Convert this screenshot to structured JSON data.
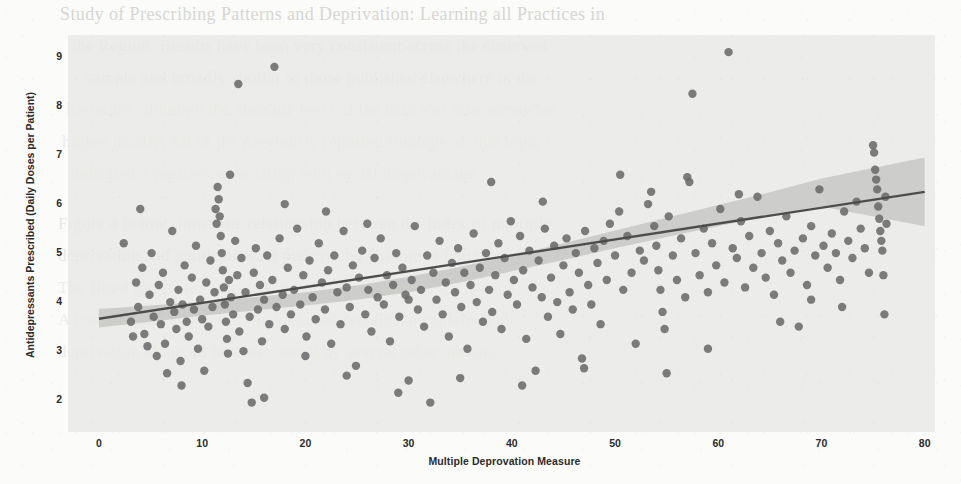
{
  "page": {
    "kind": "scanned-journal-page-with-figure",
    "background_color": "#fbfbfa",
    "ghost_text": [
      {
        "text": "Study of Prescribing Patterns and Deprivation: Learning all Practices in",
        "x": 60,
        "y": 4,
        "size": 18,
        "class": ""
      },
      {
        "text": "the Region. Results have been very consistent across the observed",
        "x": 72,
        "y": 36,
        "size": 17,
        "class": "faded"
      },
      {
        "text": "sample and broadly similar to those published elsewhere in the",
        "x": 86,
        "y": 68,
        "size": 17,
        "class": "faded"
      },
      {
        "text": "literature, although the absolute level of the data was also somewhat",
        "x": 66,
        "y": 100,
        "size": 17,
        "class": "faded2"
      },
      {
        "text": "higher locally. All of the previously reported findings on this topic",
        "x": 62,
        "y": 132,
        "size": 17,
        "class": "faded2"
      },
      {
        "text": "indicated a positive association with social disadvantage.",
        "x": 70,
        "y": 164,
        "size": 17,
        "class": "faded2"
      },
      {
        "text": "Figure 4 below shows the relationship between the index of multiple",
        "x": 58,
        "y": 214,
        "size": 17,
        "class": "faded"
      },
      {
        "text": "deprivation and antidepressant prescribing volume at practice level.",
        "x": 58,
        "y": 246,
        "size": 17,
        "class": "faded"
      },
      {
        "text": "The fitted regression line and its confidence interval are shown.",
        "x": 58,
        "y": 278,
        "size": 17,
        "class": "faded2"
      },
      {
        "text": "A considerable amount of the variation remains unexplained by",
        "x": 58,
        "y": 310,
        "size": 17,
        "class": "faded2"
      },
      {
        "text": "deprivation alone, as has been noted by several other authors.",
        "x": 58,
        "y": 342,
        "size": 17,
        "class": "faded2"
      }
    ]
  },
  "chart_data": {
    "type": "scatter",
    "title": "",
    "xlabel": "Multiple Deprovation Measure",
    "ylabel": "Antidepressants Prescribed (Daily Doses per Patient)",
    "xlim": [
      -3,
      81
    ],
    "ylim": [
      1.35,
      9.45
    ],
    "xticks": [
      0,
      10,
      20,
      30,
      40,
      50,
      60,
      70,
      80
    ],
    "yticks": [
      2,
      3,
      4,
      5,
      6,
      7,
      8,
      9
    ],
    "grid": false,
    "legend": null,
    "marker_color": "#6b6b6b",
    "marker_size": 5.2,
    "plot_bg_color": "#e9e9e6",
    "regression": {
      "color": "#4d4d4d",
      "x": [
        0,
        80
      ],
      "y": [
        3.66,
        6.25
      ],
      "slope": 0.0324,
      "intercept": 3.66,
      "band_color": "#b5b5b0",
      "band_lower": [
        3.48,
        3.6,
        3.72,
        3.83,
        3.93,
        4.05,
        4.2,
        4.4,
        4.63,
        4.86,
        5.1,
        5.33,
        5.55,
        5.76,
        5.95
      ],
      "band_upper": [
        3.86,
        3.93,
        4.01,
        4.1,
        4.2,
        4.34,
        4.52,
        4.72,
        4.95,
        5.2,
        5.46,
        5.72,
        5.98,
        6.24,
        6.52
      ],
      "band_x": [
        0,
        5,
        10,
        15,
        20,
        25,
        30,
        35,
        40,
        45,
        50,
        55,
        60,
        65,
        70
      ]
    },
    "points": [
      [
        2.4,
        5.2
      ],
      [
        3.1,
        3.6
      ],
      [
        3.3,
        3.3
      ],
      [
        3.6,
        4.4
      ],
      [
        3.8,
        3.9
      ],
      [
        4.0,
        5.9
      ],
      [
        4.2,
        4.7
      ],
      [
        4.4,
        3.35
      ],
      [
        4.7,
        3.1
      ],
      [
        4.9,
        4.15
      ],
      [
        5.1,
        5.0
      ],
      [
        5.3,
        3.7
      ],
      [
        5.6,
        2.9
      ],
      [
        5.8,
        4.35
      ],
      [
        6.0,
        3.55
      ],
      [
        6.2,
        4.6
      ],
      [
        6.4,
        3.15
      ],
      [
        6.6,
        2.55
      ],
      [
        6.9,
        4.0
      ],
      [
        7.1,
        5.45
      ],
      [
        7.3,
        3.8
      ],
      [
        7.5,
        3.45
      ],
      [
        7.7,
        4.25
      ],
      [
        7.9,
        2.8
      ],
      [
        8.1,
        3.95
      ],
      [
        8.3,
        4.75
      ],
      [
        8.5,
        3.6
      ],
      [
        8.7,
        3.3
      ],
      [
        9.0,
        4.5
      ],
      [
        9.2,
        3.85
      ],
      [
        9.4,
        5.15
      ],
      [
        9.6,
        3.05
      ],
      [
        9.8,
        4.05
      ],
      [
        10.0,
        3.65
      ],
      [
        10.2,
        2.6
      ],
      [
        10.4,
        4.4
      ],
      [
        10.6,
        3.5
      ],
      [
        10.8,
        4.85
      ],
      [
        11.0,
        3.9
      ],
      [
        11.2,
        4.2
      ],
      [
        11.4,
        5.6
      ],
      [
        11.5,
        6.35
      ],
      [
        11.6,
        6.1
      ],
      [
        11.7,
        5.75
      ],
      [
        11.8,
        5.35
      ],
      [
        11.9,
        5.0
      ],
      [
        12.0,
        4.65
      ],
      [
        12.1,
        4.3
      ],
      [
        12.2,
        3.95
      ],
      [
        12.3,
        3.6
      ],
      [
        12.4,
        3.25
      ],
      [
        12.5,
        2.95
      ],
      [
        12.6,
        4.45
      ],
      [
        12.8,
        4.1
      ],
      [
        13.0,
        3.75
      ],
      [
        13.2,
        5.25
      ],
      [
        13.4,
        4.55
      ],
      [
        13.5,
        8.45
      ],
      [
        13.6,
        3.4
      ],
      [
        13.8,
        4.9
      ],
      [
        14.0,
        3.0
      ],
      [
        14.2,
        4.2
      ],
      [
        14.4,
        2.35
      ],
      [
        14.6,
        3.7
      ],
      [
        14.8,
        1.95
      ],
      [
        15.0,
        4.6
      ],
      [
        15.2,
        5.1
      ],
      [
        15.4,
        3.85
      ],
      [
        15.6,
        4.35
      ],
      [
        15.8,
        3.2
      ],
      [
        16.0,
        4.05
      ],
      [
        16.3,
        4.95
      ],
      [
        16.5,
        3.55
      ],
      [
        16.8,
        4.45
      ],
      [
        17.0,
        8.8
      ],
      [
        17.2,
        3.9
      ],
      [
        17.5,
        5.3
      ],
      [
        17.8,
        4.15
      ],
      [
        18.0,
        3.45
      ],
      [
        18.3,
        4.7
      ],
      [
        18.6,
        3.75
      ],
      [
        18.9,
        4.25
      ],
      [
        19.2,
        5.5
      ],
      [
        19.5,
        3.95
      ],
      [
        19.8,
        4.55
      ],
      [
        20.1,
        3.3
      ],
      [
        20.4,
        4.85
      ],
      [
        20.7,
        4.1
      ],
      [
        21.0,
        3.65
      ],
      [
        21.3,
        5.2
      ],
      [
        21.6,
        4.4
      ],
      [
        21.9,
        3.85
      ],
      [
        22.2,
        4.65
      ],
      [
        22.5,
        3.15
      ],
      [
        22.8,
        4.95
      ],
      [
        23.1,
        4.2
      ],
      [
        23.4,
        3.55
      ],
      [
        23.7,
        5.45
      ],
      [
        24.0,
        4.3
      ],
      [
        24.3,
        3.9
      ],
      [
        24.6,
        4.75
      ],
      [
        24.9,
        2.7
      ],
      [
        25.2,
        4.5
      ],
      [
        25.5,
        5.05
      ],
      [
        25.8,
        3.75
      ],
      [
        26.1,
        4.25
      ],
      [
        26.4,
        3.4
      ],
      [
        26.7,
        4.9
      ],
      [
        27.0,
        4.1
      ],
      [
        27.3,
        5.3
      ],
      [
        27.6,
        3.95
      ],
      [
        27.9,
        4.55
      ],
      [
        28.2,
        3.2
      ],
      [
        28.5,
        4.35
      ],
      [
        28.8,
        5.0
      ],
      [
        29.1,
        3.7
      ],
      [
        29.4,
        4.7
      ],
      [
        29.7,
        4.15
      ],
      [
        30.0,
        2.4
      ],
      [
        30.3,
        4.45
      ],
      [
        30.6,
        5.55
      ],
      [
        30.9,
        3.85
      ],
      [
        31.2,
        4.25
      ],
      [
        31.5,
        3.5
      ],
      [
        31.8,
        4.95
      ],
      [
        32.1,
        1.95
      ],
      [
        32.4,
        4.6
      ],
      [
        32.7,
        4.05
      ],
      [
        33.0,
        5.25
      ],
      [
        33.3,
        3.75
      ],
      [
        33.6,
        4.4
      ],
      [
        33.9,
        3.3
      ],
      [
        34.2,
        4.8
      ],
      [
        34.5,
        4.2
      ],
      [
        34.8,
        5.1
      ],
      [
        35.1,
        3.9
      ],
      [
        35.4,
        4.6
      ],
      [
        35.7,
        3.05
      ],
      [
        36.0,
        4.35
      ],
      [
        36.3,
        5.4
      ],
      [
        36.6,
        4.0
      ],
      [
        36.9,
        4.7
      ],
      [
        37.2,
        3.6
      ],
      [
        37.5,
        5.0
      ],
      [
        37.8,
        4.25
      ],
      [
        38.1,
        3.8
      ],
      [
        38.4,
        4.55
      ],
      [
        38.7,
        5.2
      ],
      [
        39.0,
        3.45
      ],
      [
        39.3,
        4.9
      ],
      [
        39.6,
        4.15
      ],
      [
        39.9,
        5.65
      ],
      [
        40.2,
        4.45
      ],
      [
        40.5,
        3.95
      ],
      [
        40.8,
        5.35
      ],
      [
        41.1,
        4.65
      ],
      [
        41.4,
        3.25
      ],
      [
        41.7,
        5.05
      ],
      [
        42.0,
        4.3
      ],
      [
        42.3,
        2.6
      ],
      [
        42.6,
        4.85
      ],
      [
        42.9,
        4.1
      ],
      [
        43.2,
        5.5
      ],
      [
        43.5,
        3.7
      ],
      [
        43.8,
        4.5
      ],
      [
        44.1,
        5.15
      ],
      [
        44.4,
        4.0
      ],
      [
        44.7,
        3.35
      ],
      [
        45.0,
        4.75
      ],
      [
        45.3,
        5.3
      ],
      [
        45.6,
        4.2
      ],
      [
        45.9,
        3.85
      ],
      [
        46.2,
        5.0
      ],
      [
        46.5,
        4.6
      ],
      [
        46.8,
        2.85
      ],
      [
        47.1,
        5.45
      ],
      [
        47.4,
        4.35
      ],
      [
        47.7,
        3.95
      ],
      [
        48.0,
        5.1
      ],
      [
        48.3,
        4.8
      ],
      [
        48.6,
        3.55
      ],
      [
        48.9,
        5.25
      ],
      [
        49.2,
        4.45
      ],
      [
        49.5,
        5.6
      ],
      [
        50.0,
        4.95
      ],
      [
        50.4,
        5.85
      ],
      [
        50.8,
        4.25
      ],
      [
        51.2,
        5.35
      ],
      [
        51.6,
        4.6
      ],
      [
        52.0,
        3.15
      ],
      [
        52.4,
        5.05
      ],
      [
        52.8,
        4.85
      ],
      [
        53.2,
        6.0
      ],
      [
        53.5,
        6.25
      ],
      [
        53.8,
        5.55
      ],
      [
        54.0,
        5.15
      ],
      [
        54.2,
        4.65
      ],
      [
        54.4,
        4.25
      ],
      [
        54.6,
        3.8
      ],
      [
        54.8,
        3.45
      ],
      [
        55.2,
        5.75
      ],
      [
        55.6,
        4.95
      ],
      [
        56.0,
        4.45
      ],
      [
        56.4,
        5.3
      ],
      [
        56.8,
        4.1
      ],
      [
        57.2,
        6.45
      ],
      [
        57.5,
        8.25
      ],
      [
        57.8,
        5.0
      ],
      [
        58.2,
        4.55
      ],
      [
        58.6,
        5.5
      ],
      [
        59.0,
        4.2
      ],
      [
        59.4,
        5.2
      ],
      [
        59.8,
        4.75
      ],
      [
        60.2,
        5.9
      ],
      [
        60.6,
        4.4
      ],
      [
        61.0,
        9.1
      ],
      [
        61.4,
        5.1
      ],
      [
        61.8,
        4.9
      ],
      [
        62.2,
        5.65
      ],
      [
        62.6,
        4.3
      ],
      [
        63.0,
        5.35
      ],
      [
        63.4,
        4.7
      ],
      [
        63.8,
        6.15
      ],
      [
        64.2,
        5.0
      ],
      [
        64.6,
        4.5
      ],
      [
        65.0,
        5.45
      ],
      [
        65.4,
        4.15
      ],
      [
        65.8,
        5.2
      ],
      [
        66.2,
        4.85
      ],
      [
        66.6,
        5.75
      ],
      [
        67.0,
        4.6
      ],
      [
        67.4,
        5.05
      ],
      [
        67.8,
        3.5
      ],
      [
        68.2,
        5.3
      ],
      [
        68.6,
        4.35
      ],
      [
        69.0,
        5.55
      ],
      [
        69.4,
        4.95
      ],
      [
        69.8,
        6.3
      ],
      [
        70.2,
        5.15
      ],
      [
        70.6,
        4.7
      ],
      [
        71.0,
        5.4
      ],
      [
        71.4,
        5.0
      ],
      [
        71.8,
        4.45
      ],
      [
        72.2,
        5.85
      ],
      [
        72.6,
        5.25
      ],
      [
        73.0,
        4.9
      ],
      [
        73.4,
        6.05
      ],
      [
        73.8,
        5.5
      ],
      [
        74.2,
        5.1
      ],
      [
        74.6,
        4.6
      ],
      [
        75.0,
        7.2
      ],
      [
        75.1,
        7.05
      ],
      [
        75.2,
        6.7
      ],
      [
        75.3,
        6.5
      ],
      [
        75.4,
        6.3
      ],
      [
        75.5,
        5.95
      ],
      [
        75.6,
        5.7
      ],
      [
        75.7,
        5.45
      ],
      [
        75.8,
        5.25
      ],
      [
        75.9,
        5.05
      ],
      [
        76.0,
        4.55
      ],
      [
        76.1,
        3.75
      ],
      [
        76.2,
        6.15
      ],
      [
        76.3,
        5.6
      ],
      [
        30.0,
        4.05
      ],
      [
        22.0,
        5.85
      ],
      [
        18.0,
        6.0
      ],
      [
        12.7,
        6.6
      ],
      [
        11.3,
        5.9
      ],
      [
        43.0,
        6.05
      ],
      [
        50.5,
        6.6
      ],
      [
        57.0,
        6.55
      ],
      [
        62.0,
        6.2
      ],
      [
        38.0,
        6.45
      ],
      [
        26.0,
        5.6
      ],
      [
        20.0,
        2.9
      ],
      [
        24.0,
        2.5
      ],
      [
        35.0,
        2.45
      ],
      [
        47.0,
        2.65
      ],
      [
        55.0,
        2.55
      ],
      [
        66.0,
        3.6
      ],
      [
        72.0,
        3.9
      ],
      [
        8.0,
        2.3
      ],
      [
        16.0,
        2.05
      ],
      [
        29.0,
        2.15
      ],
      [
        41.0,
        2.3
      ],
      [
        59.0,
        3.05
      ],
      [
        69.0,
        4.05
      ]
    ]
  }
}
